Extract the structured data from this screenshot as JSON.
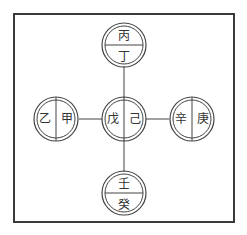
{
  "title": {
    "text": "",
    "clipped": true
  },
  "diagram": {
    "type": "heavenly-stems-five-directions",
    "stroke_color": "#3a3a3a",
    "frame_color": "#3a3a3a",
    "nodes": {
      "top": {
        "position": "south-top",
        "split": "horizontal",
        "upper": "丙",
        "lower": "丁"
      },
      "left": {
        "position": "east-left",
        "split": "vertical",
        "left": "乙",
        "right": "甲"
      },
      "center": {
        "position": "center",
        "split": "vertical",
        "left": "戊",
        "right": "己"
      },
      "right": {
        "position": "west-right",
        "split": "vertical",
        "left": "辛",
        "right": "庚"
      },
      "bottom": {
        "position": "north-bottom",
        "split": "horizontal",
        "upper": "壬",
        "lower": "癸"
      }
    },
    "connectors": [
      "center-top",
      "center-left",
      "center-right",
      "center-bottom"
    ]
  }
}
